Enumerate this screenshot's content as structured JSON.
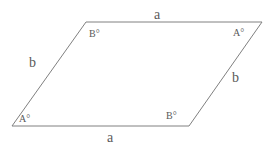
{
  "figure": {
    "type": "parallelogram",
    "background_color": "#ffffff",
    "stroke_color": "#808080",
    "stroke_width": 1,
    "text_color": "#5a5a5a",
    "vertices": {
      "top_left": {
        "x": 86,
        "y": 22
      },
      "top_right": {
        "x": 262,
        "y": 22
      },
      "bottom_right": {
        "x": 189,
        "y": 126
      },
      "bottom_left": {
        "x": 12,
        "y": 126
      }
    },
    "path": "86,22 262,22 189,126 12,126"
  },
  "labels": {
    "side_a_top": "a",
    "side_a_bottom": "a",
    "side_b_left": "b",
    "side_b_right": "b",
    "angle_B_top_left": "B°",
    "angle_A_top_right": "A°",
    "angle_A_bottom_left": "A°",
    "angle_B_bottom_right": "B°"
  }
}
